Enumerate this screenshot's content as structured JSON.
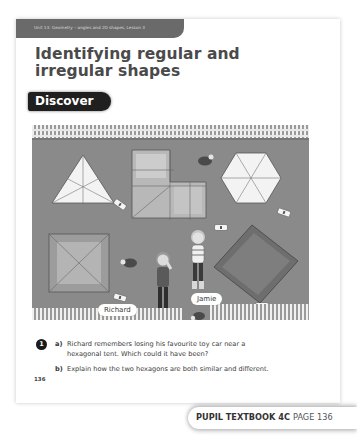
{
  "header": {
    "unit_banner": "Unit 13: Geometry – angles and 2D shapes, Lesson 3",
    "title_line1": "Identifying regular and",
    "title_line2": "irregular shapes",
    "section_label": "Discover"
  },
  "illustration": {
    "description": "Campsite seen from above with tents of different shapes and toy cars with numbered tags",
    "tents": [
      {
        "shape": "triangle",
        "type": "regular"
      },
      {
        "shape": "L-shaped hexagon",
        "type": "irregular"
      },
      {
        "shape": "hexagon",
        "type": "regular"
      },
      {
        "shape": "square",
        "type": "regular"
      },
      {
        "shape": "rectangle",
        "type": "irregular"
      }
    ],
    "characters": [
      {
        "name": "Richard"
      },
      {
        "name": "Jamie"
      }
    ]
  },
  "questions": [
    {
      "number": "1",
      "parts": [
        {
          "letter": "a)",
          "text_line1": "Richard remembers losing his favourite toy car near a",
          "text_line2": "hexagonal tent. Which could it have been?"
        },
        {
          "letter": "b)",
          "text_line1": "Explain how the two hexagons are both similar and different."
        }
      ]
    }
  ],
  "footer": {
    "page_number": "136",
    "book_label": "PUPIL TEXTBOOK 4C",
    "page_label": "PAGE 136"
  },
  "colors": {
    "banner": "#6a6a6a",
    "discover_bg": "#1f1f1f",
    "ground": "#8a8a8a",
    "title": "#4a4a4a"
  }
}
